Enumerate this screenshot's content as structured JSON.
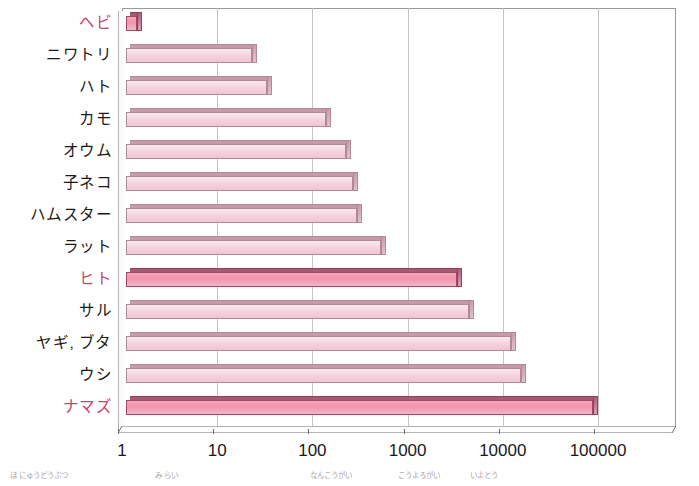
{
  "chart_data": {
    "type": "bar",
    "orientation": "horizontal",
    "title": "",
    "xlabel": "",
    "ylabel": "",
    "xscale": "log",
    "xlim": [
      1,
      100000
    ],
    "xticks": [
      "1",
      "10",
      "100",
      "1000",
      "10000",
      "100000"
    ],
    "xtick_values": [
      1,
      10,
      100,
      1000,
      10000,
      100000
    ],
    "grid": true,
    "legend": "none",
    "style": "3d-bar",
    "categories": [
      "ヘビ",
      "ニワトリ",
      "ハト",
      "カモ",
      "オウム",
      "子ネコ",
      "ハムスター",
      "ラット",
      "ヒト",
      "サル",
      "ヤギ, ブタ",
      "ウシ",
      "ナマズ"
    ],
    "values": [
      1.3,
      21,
      30,
      125,
      205,
      245,
      270,
      480,
      3000,
      4000,
      11000,
      14000,
      80000
    ],
    "highlighted": [
      "ヘビ",
      "ヒト",
      "ナマズ"
    ],
    "colors": {
      "bar_fill": "#f6d4e0",
      "bar_fill_highlight": "#f295ae",
      "bar_edge": "#b08a97",
      "bar_top": "#c79aa8",
      "bar_top_highlight": "#a85a74",
      "label_highlight": "#c9436f",
      "label": "#1a1a1a",
      "grid": "#c4c4c4",
      "frame": "#9a9a9a",
      "background": "#ffffff"
    }
  },
  "y_axis": {
    "labels": [
      {
        "text": "ヘビ",
        "highlight": true
      },
      {
        "text": "ニワトリ",
        "highlight": false
      },
      {
        "text": "ハト",
        "highlight": false
      },
      {
        "text": "カモ",
        "highlight": false
      },
      {
        "text": "オウム",
        "highlight": false
      },
      {
        "text": "子ネコ",
        "highlight": false
      },
      {
        "text": "ハムスター",
        "highlight": false
      },
      {
        "text": "ラット",
        "highlight": false
      },
      {
        "text": "ヒト",
        "highlight": true
      },
      {
        "text": "サル",
        "highlight": false
      },
      {
        "text": "ヤギ, ブタ",
        "highlight": false
      },
      {
        "text": "ウシ",
        "highlight": false
      },
      {
        "text": "ナマズ",
        "highlight": true
      }
    ]
  },
  "x_axis": {
    "ticks": [
      {
        "label": "1",
        "value": 1
      },
      {
        "label": "10",
        "value": 10
      },
      {
        "label": "100",
        "value": 100
      },
      {
        "label": "1000",
        "value": 1000
      },
      {
        "label": "10000",
        "value": 10000
      },
      {
        "label": "100000",
        "value": 100000
      }
    ]
  },
  "furigana": [
    {
      "text": "ほ にゅうどうぶつ",
      "x": 10
    },
    {
      "text": "み らい",
      "x": 155
    },
    {
      "text": "なんこうがい",
      "x": 310
    },
    {
      "text": "こうよろがい",
      "x": 398
    },
    {
      "text": "いよとう",
      "x": 470
    }
  ]
}
